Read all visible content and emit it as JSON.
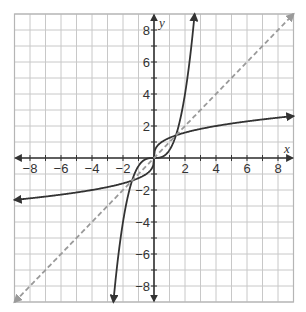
{
  "chart_data": {
    "type": "line",
    "title": "",
    "xlabel": "x",
    "ylabel": "y",
    "xlim": [
      -9,
      9
    ],
    "ylim": [
      -9,
      9
    ],
    "grid": true,
    "grid_step": 1,
    "x_tick_labels": [
      "-8",
      "-6",
      "-4",
      "-2",
      "2",
      "4",
      "6",
      "8"
    ],
    "x_ticks": [
      -8,
      -6,
      -4,
      -2,
      2,
      4,
      6,
      8
    ],
    "y_tick_labels": [
      "8",
      "6",
      "4",
      "2",
      "-2",
      "-4",
      "-6",
      "-8"
    ],
    "y_ticks": [
      8,
      6,
      4,
      2,
      -2,
      -4,
      -6,
      -8
    ],
    "series": [
      {
        "name": "f(x) = x^3/2",
        "style": "solid",
        "color": "#333333",
        "x": [
          -2.62,
          -2.5,
          -2,
          -1.5,
          -1,
          -0.5,
          0,
          0.5,
          1,
          1.5,
          2,
          2.5,
          2.62
        ],
        "values": [
          -9.0,
          -7.81,
          -4.0,
          -1.69,
          -0.5,
          -0.06,
          0,
          0.06,
          0.5,
          1.69,
          4.0,
          7.81,
          9.0
        ],
        "arrows": "both"
      },
      {
        "name": "f^-1(x) = cbrt(2x)",
        "style": "solid",
        "color": "#333333",
        "x": [
          -9,
          -8,
          -6,
          -4,
          -2,
          -1,
          -0.5,
          0,
          0.5,
          1,
          2,
          4,
          6,
          8,
          9
        ],
        "values": [
          -2.62,
          -2.52,
          -2.29,
          -2.0,
          -1.59,
          -1.26,
          -1.0,
          0,
          1.0,
          1.26,
          1.59,
          2.0,
          2.29,
          2.52,
          2.62
        ],
        "arrows": "both"
      },
      {
        "name": "y = x",
        "style": "dashed",
        "color": "#999999",
        "x": [
          -9,
          9
        ],
        "values": [
          -9,
          9
        ],
        "arrows": "both"
      }
    ],
    "intersections": [
      [
        -1.41,
        -1.41
      ],
      [
        0,
        0
      ],
      [
        1.41,
        1.41
      ]
    ]
  },
  "axes": {
    "x_name": "x",
    "y_name": "y"
  },
  "colors": {
    "curve": "#333333",
    "dashed_line": "#9a9a9a",
    "grid": "#c8c8c8",
    "axis": "#333333",
    "border": "#b5b5b5"
  }
}
